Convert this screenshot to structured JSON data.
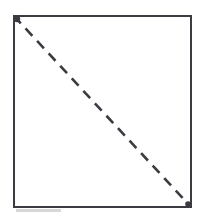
{
  "figure": {
    "title": "Rectangle with dashed diagonal",
    "description": "A tall rectangle outlined with a solid dark stroke, crossed by a dashed diagonal line running from the top-left corner to the bottom-right corner.",
    "canvas": {
      "width": 201,
      "height": 224,
      "background_color": "#ffffff"
    },
    "shapes": {
      "rectangle": {
        "name": "rectangle-outline",
        "x": 14,
        "y": 16,
        "width": 177,
        "height": 191,
        "stroke_color": "#3b3b42",
        "stroke_width": 2.2,
        "fill": "none"
      },
      "diagonal": {
        "name": "dashed-diagonal",
        "x1": 14,
        "y1": 16,
        "x2": 191,
        "y2": 207,
        "stroke_color": "#3b3b42",
        "stroke_width": 2.6,
        "dash_length": 10,
        "gap_length": 7,
        "direction": "top-left to bottom-right"
      },
      "start_marker": {
        "name": "diagonal-start-marker",
        "cx": 17,
        "cy": 19,
        "radius": 3.2,
        "color": "#3b3b42"
      },
      "end_marker": {
        "name": "diagonal-end-marker",
        "cx": 188,
        "cy": 204,
        "radius": 2.8,
        "color": "#3b3b42"
      },
      "smudge": {
        "name": "scan-smudge",
        "x": 16,
        "y": 209,
        "width": 45,
        "height": 3,
        "color": "#c9c9cd"
      }
    }
  }
}
